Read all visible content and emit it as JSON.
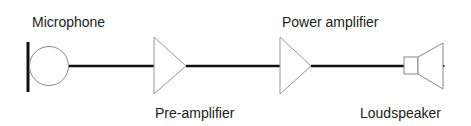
{
  "diagram": {
    "components": [
      {
        "id": "microphone",
        "label": "Microphone"
      },
      {
        "id": "pre-amplifier",
        "label": "Pre-amplifier"
      },
      {
        "id": "power-amplifier",
        "label": "Power amplifier"
      },
      {
        "id": "loudspeaker",
        "label": "Loudspeaker"
      }
    ],
    "connections": [
      {
        "from": "microphone",
        "to": "pre-amplifier"
      },
      {
        "from": "pre-amplifier",
        "to": "power-amplifier"
      },
      {
        "from": "power-amplifier",
        "to": "loudspeaker"
      }
    ],
    "colors": {
      "line": "#111111",
      "outline": "#999999",
      "text": "#222222",
      "background": "#ffffff"
    }
  }
}
